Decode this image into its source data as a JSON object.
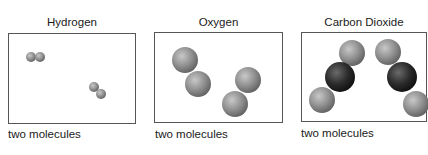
{
  "panels": [
    {
      "title": "Hydrogen",
      "caption": "two molecules",
      "molecule_count": 2,
      "atoms_per_molecule": 2,
      "atom_types": [
        "H",
        "H"
      ]
    },
    {
      "title": "Oxygen",
      "caption": "two molecules",
      "molecule_count": 2,
      "atoms_per_molecule": 2,
      "atom_types": [
        "O",
        "O"
      ]
    },
    {
      "title": "Carbon Dioxide",
      "caption": "two molecules",
      "molecule_count": 2,
      "atoms_per_molecule": 3,
      "atom_types": [
        "O",
        "C",
        "O"
      ]
    }
  ],
  "colors": {
    "light_atom": "#8f8f8f",
    "dark_atom": "#2a2a2a",
    "box_border": "#555555"
  }
}
